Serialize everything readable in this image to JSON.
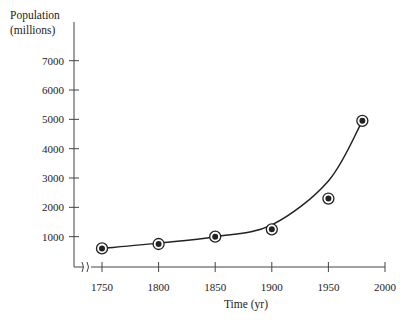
{
  "chart_data": {
    "type": "line",
    "title": "",
    "xlabel": "Time (yr)",
    "ylabel": "Population (millions)",
    "ylabel_lines": [
      "Population",
      "(millions)"
    ],
    "x_ticks": [
      1750,
      1800,
      1850,
      1900,
      1950,
      2000
    ],
    "y_ticks": [
      1000,
      2000,
      3000,
      4000,
      5000,
      6000,
      7000
    ],
    "xlim": [
      1725,
      2000
    ],
    "ylim": [
      0,
      7500
    ],
    "axis_break_x": true,
    "grid": false,
    "legend": null,
    "series": [
      {
        "name": "Observed population",
        "style": "circled-dot markers",
        "x": [
          1750,
          1800,
          1850,
          1900,
          1950,
          1980
        ],
        "values": [
          600,
          750,
          1000,
          1250,
          2300,
          4950
        ]
      },
      {
        "name": "Fitted exponential curve",
        "style": "smooth line",
        "x": [
          1750,
          1800,
          1850,
          1900,
          1950,
          1980
        ],
        "values": [
          600,
          780,
          1000,
          1400,
          2900,
          4950
        ]
      }
    ]
  },
  "colors": {
    "ink": "#222222",
    "axis": "#444444",
    "background": "#ffffff"
  }
}
